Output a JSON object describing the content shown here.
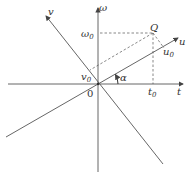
{
  "diagram": {
    "type": "coordinate-rotation",
    "colors": {
      "line": "#555555",
      "dashed": "#555555",
      "text": "#333333"
    },
    "labels": {
      "t_axis": "t",
      "omega_axis": "ω",
      "u_axis": "u",
      "v_axis": "v",
      "origin": "0",
      "point": "Q",
      "omega0": "ω",
      "omega0_sub": "0",
      "t0": "t",
      "t0_sub": "0",
      "u0": "u",
      "u0_sub": "0",
      "v0": "v",
      "v0_sub": "0",
      "angle": "α"
    }
  }
}
